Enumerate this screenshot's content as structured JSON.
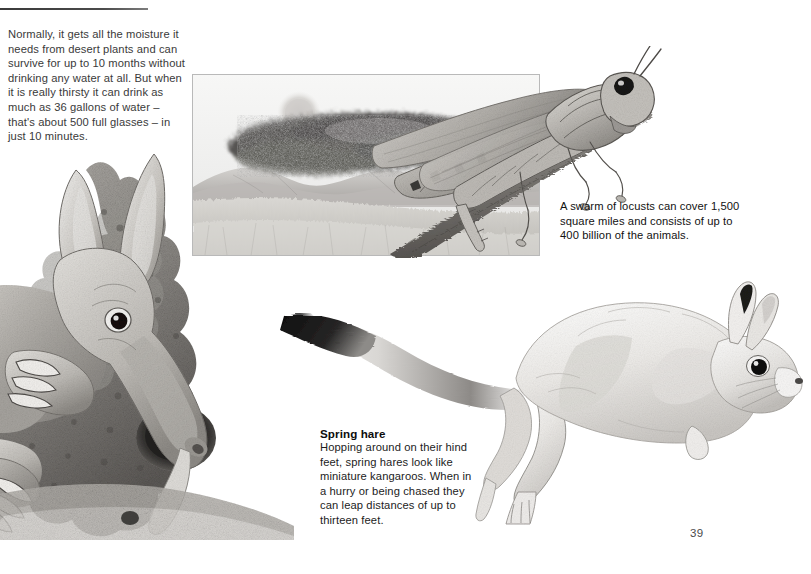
{
  "page": {
    "number": "39",
    "background_color": "#ffffff",
    "text_color": "#242424",
    "rule_color": "#3a3a3a"
  },
  "body_text": "Normally, it gets all the moisture it needs from desert plants and can survive for up to 10 months without drinking any water at all. But when it is really thirsty it can drink as much as 36 gallons of water – that's about 500 full glasses – in just 10 minutes.",
  "captions": {
    "locust": "A swarm of locusts can cover 1,500 square miles and consists of up to 400 billion of the animals.",
    "spring_hare_heading": "Spring hare",
    "spring_hare_body": "Hopping around on their hind feet, spring hares look like miniature kangaroos. When in a hurry or being chased they can leap distances of up to thirteen feet."
  },
  "illustrations": {
    "aardvark": {
      "name": "aardvark-at-termite-mound",
      "description": "Pencil drawing of an aardvark with long ears and snout digging into a termite mound",
      "palette": {
        "light": "#e9e7e4",
        "mid": "#b5b2ad",
        "dark": "#6d6a66",
        "darkest": "#2a2927"
      }
    },
    "locust_panel": {
      "name": "locust-swarm-panel",
      "description": "Framed landscape drawing of a locust swarm cloud over savanna hills with setting sun",
      "palette": {
        "sky": "#f3f3f2",
        "swarm": "#4e4d4c",
        "hills": "#a9a7a4",
        "grass": "#c8c6c2"
      }
    },
    "locust": {
      "name": "locust-on-branch",
      "description": "Large detailed pencil drawing of a locust perched on a twig",
      "palette": {
        "light": "#d8d6d2",
        "mid": "#9d9a96",
        "dark": "#56534f"
      }
    },
    "spring_hare": {
      "name": "spring-hare-leaping",
      "description": "Pencil drawing of a spring hare mid-leap with long black-tipped tail",
      "palette": {
        "light": "#f0efee",
        "mid": "#c6c4c0",
        "dark": "#7a7773",
        "tail_tip": "#1a1a1a"
      }
    }
  }
}
